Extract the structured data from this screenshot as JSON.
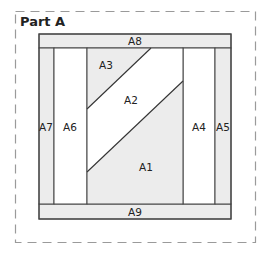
{
  "title": "Part A",
  "colors": {
    "shaded": "#ececec",
    "white": "#ffffff",
    "line": "#444444",
    "dash": "#9a9a9a"
  },
  "pieces": [
    {
      "id": "A1",
      "label": "A1",
      "shaded": true
    },
    {
      "id": "A2",
      "label": "A2",
      "shaded": false
    },
    {
      "id": "A3",
      "label": "A3",
      "shaded": true
    },
    {
      "id": "A4",
      "label": "A4",
      "shaded": false
    },
    {
      "id": "A5",
      "label": "A5",
      "shaded": true
    },
    {
      "id": "A6",
      "label": "A6",
      "shaded": false
    },
    {
      "id": "A7",
      "label": "A7",
      "shaded": true
    },
    {
      "id": "A8",
      "label": "A8",
      "shaded": true
    },
    {
      "id": "A9",
      "label": "A9",
      "shaded": true
    }
  ]
}
